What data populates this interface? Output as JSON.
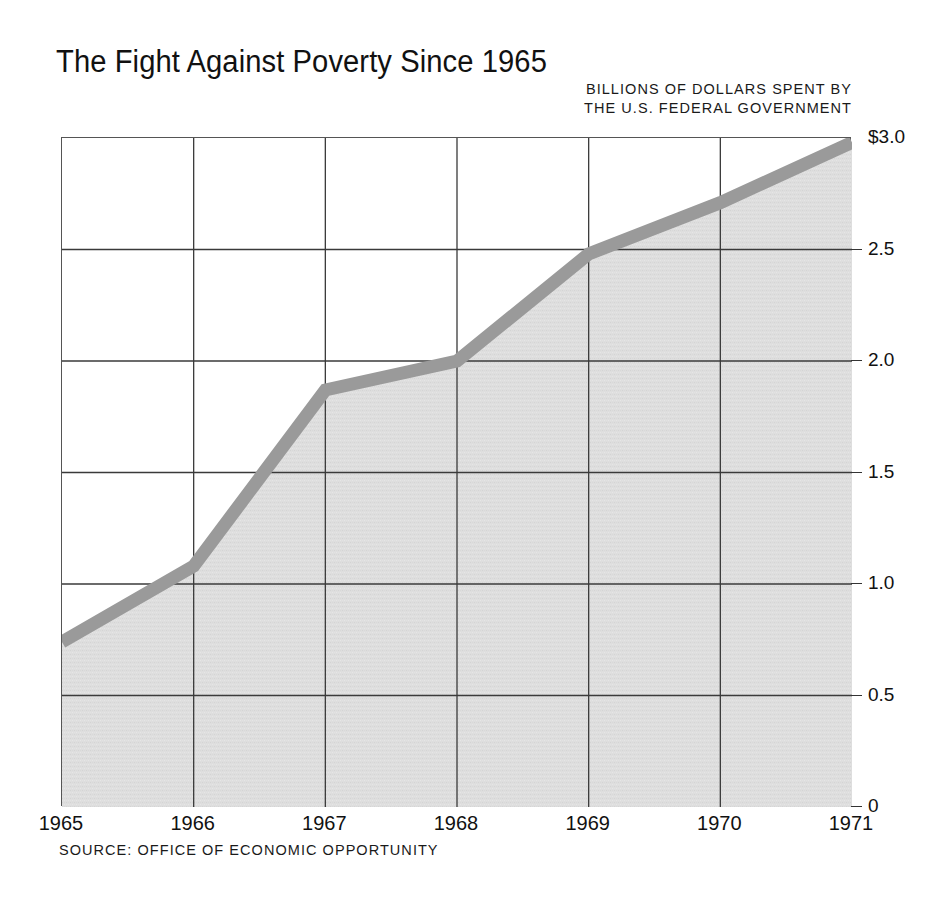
{
  "chart_data": {
    "type": "area",
    "title": "The Fight Against Poverty Since 1965",
    "subtitle_line1": "BILLIONS OF DOLLARS SPENT BY",
    "subtitle_line2": "THE U.S. FEDERAL GOVERNMENT",
    "source": "SOURCE: OFFICE OF ECONOMIC OPPORTUNITY",
    "xlabel": "",
    "ylabel": "Billions of dollars spent by the U.S. federal government",
    "categories": [
      1965,
      1966,
      1967,
      1968,
      1969,
      1970,
      1971
    ],
    "x_tick_labels": [
      "1965",
      "1966",
      "1967",
      "1968",
      "1969",
      "1970",
      "1971"
    ],
    "values": [
      0.74,
      1.08,
      1.87,
      2.0,
      2.48,
      2.71,
      2.98
    ],
    "y_tick_values": [
      3.0,
      2.5,
      2.0,
      1.5,
      1.0,
      0.5,
      0
    ],
    "y_tick_labels": [
      "$3.0",
      "2.5",
      "2.0",
      "1.5",
      "1.0",
      "0.5",
      "0"
    ],
    "ylim": [
      0,
      3.0
    ],
    "xlim": [
      1965,
      1971
    ],
    "grid": true,
    "legend": "none",
    "series_name": "Federal anti-poverty spending",
    "colors": {
      "area_fill": "#dedede",
      "line_band": "#9a9a9a",
      "gridline": "#3a3a3a",
      "frame": "#555555",
      "text": "#111111",
      "background": "#ffffff"
    }
  }
}
